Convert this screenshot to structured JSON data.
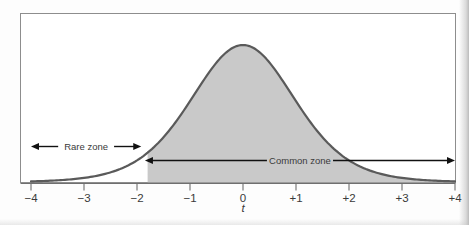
{
  "figure": {
    "kind": "statistics-distribution-figure",
    "border_color": "#8d8d8d",
    "plot_background": "#ffffff"
  },
  "chart_data": {
    "type": "area",
    "title": "",
    "subtitle": "",
    "xlabel": "t",
    "ylabel": "",
    "grid": false,
    "legend": false,
    "xlim": [
      -4,
      4
    ],
    "ylim": [
      0,
      1
    ],
    "curve": {
      "name": "t distribution",
      "shape": "bell",
      "peak_x": 0,
      "peak_y": 1,
      "stroke_color": "#5a5a5a",
      "stroke_width": 2.2,
      "x": [
        -4,
        -3.5,
        -3,
        -2.5,
        -2,
        -1.8,
        -1.5,
        -1,
        -0.5,
        0,
        0.5,
        1,
        1.5,
        1.8,
        2,
        2.5,
        3,
        3.5,
        4
      ],
      "y": [
        0.016,
        0.026,
        0.047,
        0.087,
        0.163,
        0.213,
        0.306,
        0.543,
        0.846,
        1.0,
        0.846,
        0.543,
        0.306,
        0.213,
        0.163,
        0.087,
        0.047,
        0.026,
        0.016
      ]
    },
    "shaded_region": {
      "name": "common-zone-fill",
      "fill_color": "#c9c9c9",
      "x_start": -1.8,
      "x_end": 4.05
    },
    "ticks": [
      {
        "value": -4,
        "label": "−4"
      },
      {
        "value": -3,
        "label": "−3"
      },
      {
        "value": -2,
        "label": "−2"
      },
      {
        "value": -1,
        "label": "−1"
      },
      {
        "value": 0,
        "label": "0"
      },
      {
        "value": 1,
        "label": "+1"
      },
      {
        "value": 2,
        "label": "+2"
      },
      {
        "value": 3,
        "label": "+3"
      },
      {
        "value": 4,
        "label": "+4"
      }
    ],
    "annotations": [
      {
        "id": "rare-zone",
        "label": "Rare zone",
        "arrow": "double-headed",
        "x_start": -4.0,
        "x_end": -1.92,
        "row": "upper"
      },
      {
        "id": "common-zone",
        "label": "Common zone",
        "arrow": "double-headed",
        "x_start": -1.85,
        "x_end": 4.0,
        "row": "lower"
      }
    ]
  }
}
